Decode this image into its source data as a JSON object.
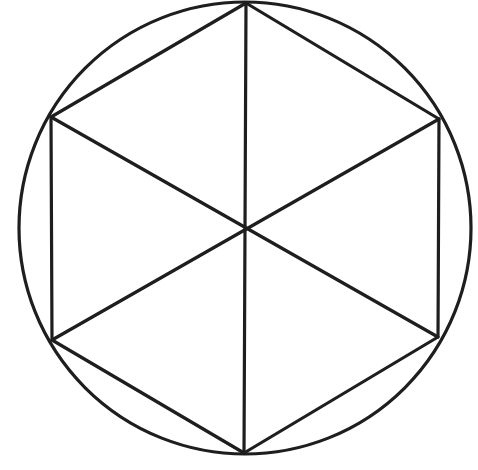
{
  "diagram": {
    "title": "",
    "stroke_color": "#1e1e1e",
    "stroke_width": 3.2,
    "background": "#ffffff",
    "circle": {
      "cx": 245,
      "cy": 228,
      "r": 226
    },
    "center": {
      "x": 246,
      "y": 228
    },
    "vertices": [
      {
        "id": "top",
        "x": 246,
        "y": 3
      },
      {
        "id": "upper-right",
        "x": 439,
        "y": 119
      },
      {
        "id": "lower-right",
        "x": 438,
        "y": 337
      },
      {
        "id": "bottom",
        "x": 244,
        "y": 453
      },
      {
        "id": "lower-left",
        "x": 52,
        "y": 340
      },
      {
        "id": "upper-left",
        "x": 51,
        "y": 117
      }
    ],
    "diagonals": [
      {
        "from": "top",
        "to": "bottom"
      },
      {
        "from": "upper-right",
        "to": "lower-left"
      },
      {
        "from": "upper-left",
        "to": "lower-right"
      }
    ]
  }
}
